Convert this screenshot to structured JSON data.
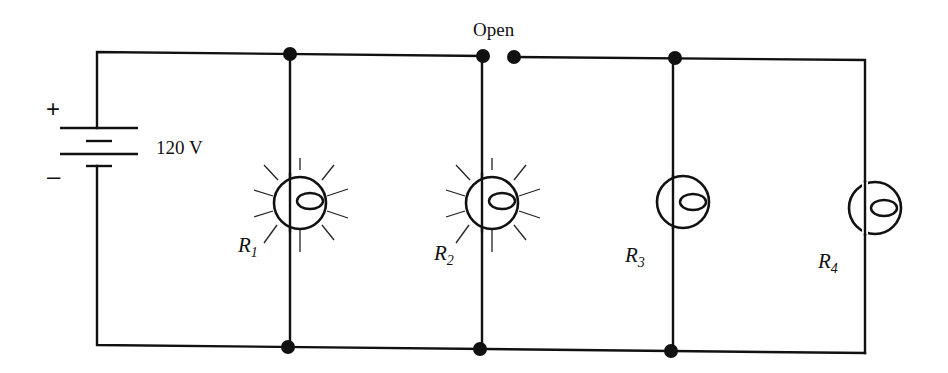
{
  "diagram": {
    "type": "parallel-circuit",
    "battery": {
      "voltage_label": "120 V",
      "positive_sign": "+",
      "negative_sign": "–"
    },
    "switch": {
      "label": "Open",
      "state": "open"
    },
    "resistors": [
      {
        "symbol": "R",
        "subscript": "1",
        "state": "lit"
      },
      {
        "symbol": "R",
        "subscript": "2",
        "state": "lit"
      },
      {
        "symbol": "R",
        "subscript": "3",
        "state": "unlit"
      },
      {
        "symbol": "R",
        "subscript": "4",
        "state": "unlit"
      }
    ],
    "colors": {
      "line": "#111111",
      "background": "#ffffff"
    }
  }
}
